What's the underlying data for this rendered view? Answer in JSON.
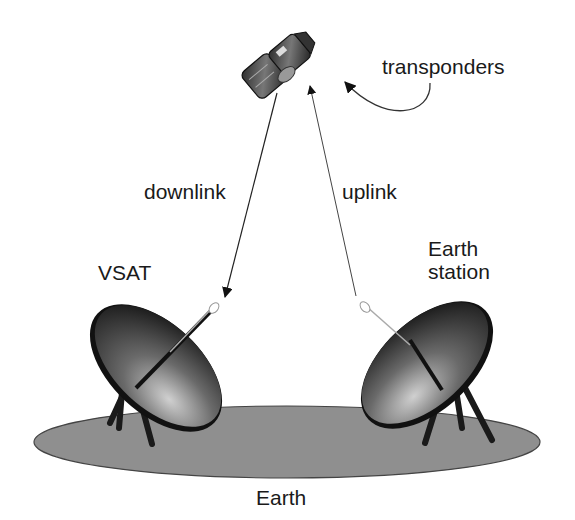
{
  "diagram": {
    "type": "satellite-link-diagram",
    "nodes": [
      {
        "id": "satellite",
        "label": ""
      },
      {
        "id": "vsat",
        "label": "VSAT"
      },
      {
        "id": "earth_station",
        "label_line1": "Earth",
        "label_line2": "station"
      },
      {
        "id": "earth",
        "label": "Earth"
      }
    ],
    "edges": [
      {
        "from": "satellite",
        "to": "vsat",
        "label": "downlink"
      },
      {
        "from": "earth_station",
        "to": "satellite",
        "label": "uplink"
      }
    ],
    "annotations": [
      {
        "target": "satellite",
        "label": "transponders"
      }
    ]
  },
  "labels": {
    "transponders": "transponders",
    "downlink": "downlink",
    "uplink": "uplink",
    "vsat": "VSAT",
    "earth_station_1": "Earth",
    "earth_station_2": "station",
    "earth": "Earth"
  },
  "colors": {
    "ground": "#8f8f8f",
    "dish_dark": "#1e1e1e",
    "dish_light": "#bdbdbd",
    "line": "#333333"
  }
}
